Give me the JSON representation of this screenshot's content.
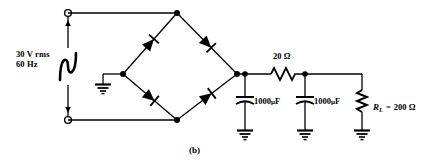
{
  "figure": {
    "caption": "(b)",
    "type": "full-wave bridge rectifier with capacitor filter"
  },
  "source": {
    "name": "ac-voltage-source",
    "voltage": "30 V rms",
    "frequency": "60 Hz",
    "symbol": "sine-wave"
  },
  "components": {
    "series_resistor": {
      "label": "20 Ω",
      "name": "resistor-20-ohm"
    },
    "capacitor_1": {
      "value": "1000",
      "unit_mu": "μ",
      "unit_f": "F",
      "name": "capacitor-1000uf-first"
    },
    "capacitor_2": {
      "value": "1000",
      "unit_mu": "μ",
      "unit_f": "F",
      "name": "capacitor-1000uf-second"
    },
    "load_resistor": {
      "symbol": "R",
      "subscript": "L",
      "equals": "=",
      "value": "200 Ω",
      "name": "load-resistor-rl"
    },
    "diodes": [
      {
        "name": "diode-upper-left",
        "direction": "up-right"
      },
      {
        "name": "diode-upper-right",
        "direction": "down-right"
      },
      {
        "name": "diode-lower-left",
        "direction": "down-right"
      },
      {
        "name": "diode-lower-right",
        "direction": "up-right"
      }
    ],
    "grounds": [
      {
        "name": "ground-bridge-left"
      },
      {
        "name": "ground-capacitor-1"
      },
      {
        "name": "ground-capacitor-2"
      },
      {
        "name": "ground-load-resistor"
      }
    ],
    "terminals": [
      {
        "name": "terminal-top-left"
      },
      {
        "name": "terminal-bottom-left"
      }
    ]
  },
  "colors": {
    "wire": "#000000",
    "background": "#ffffff",
    "text": "#000000"
  }
}
